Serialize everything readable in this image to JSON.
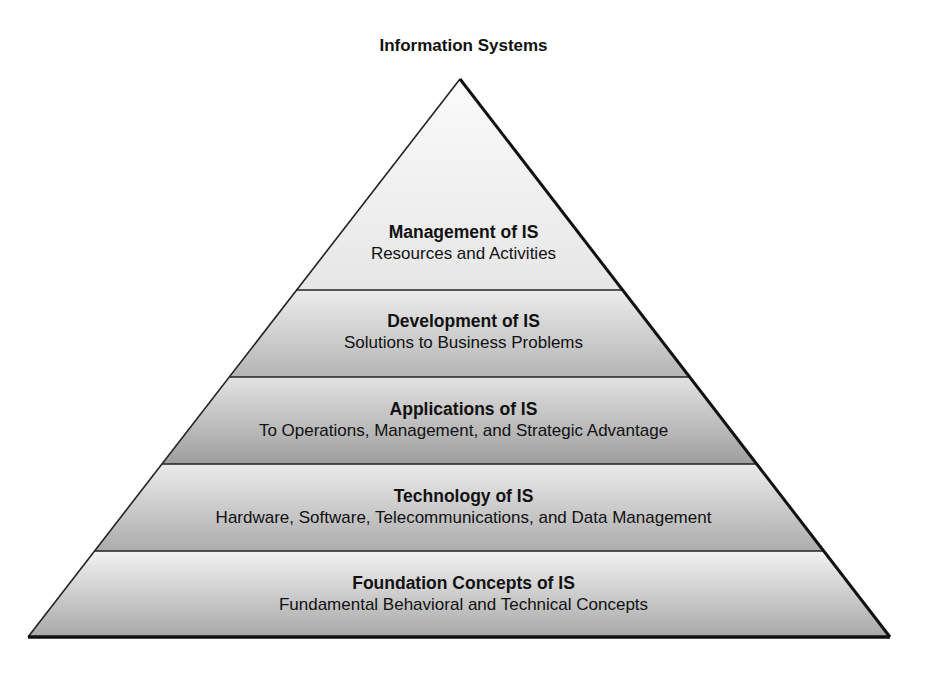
{
  "title": "Information Systems",
  "layers": [
    {
      "heading": "Management of IS",
      "subtitle": "Resources and Activities"
    },
    {
      "heading": "Development of IS",
      "subtitle": "Solutions to Business Problems"
    },
    {
      "heading": "Applications of IS",
      "subtitle": "To Operations, Management, and Strategic Advantage"
    },
    {
      "heading": "Technology of IS",
      "subtitle": "Hardware, Software, Telecommunications, and Data Management"
    },
    {
      "heading": "Foundation Concepts of IS",
      "subtitle": "Fundamental Behavioral and Technical Concepts"
    }
  ],
  "colors": {
    "outline": "#111111",
    "layer_top": "#f4f4f4",
    "layer_mid": "#c8c8c8",
    "layer_dark": "#a9a9a9"
  }
}
